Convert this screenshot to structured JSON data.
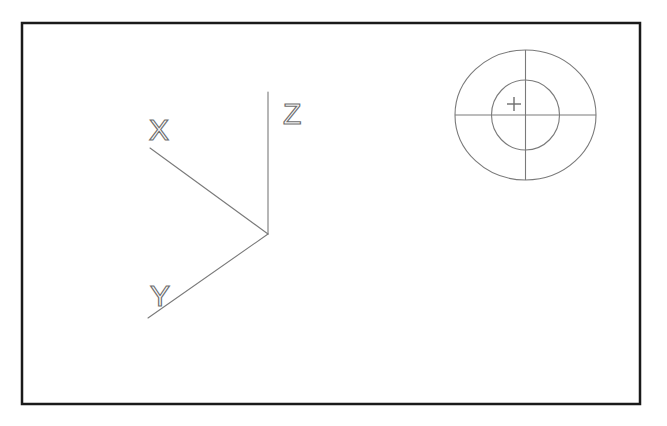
{
  "sheet": {
    "title": "CAD Drawing Sheet",
    "width": 667,
    "height": 426,
    "background_color": "#ffffff"
  },
  "border": {
    "name": "drawing-frame",
    "x": 22,
    "y": 23,
    "width": 618,
    "height": 381,
    "stroke_color": "#1a1a1a",
    "stroke_width": 2.5
  },
  "geometry": {
    "stroke_color": "#7a7a7a",
    "stroke_width": 1.1,
    "label_color": "#6e6e6e",
    "label_stroke_width": 1.2,
    "label_font_size": 30
  },
  "axis_indicator": {
    "name": "coordinate-axis-indicator",
    "origin": {
      "x": 268,
      "y": 234
    },
    "axes": [
      {
        "id": "x",
        "label": "X",
        "line": {
          "x1": 268,
          "y1": 234,
          "x2": 150,
          "y2": 148
        },
        "label_pos": {
          "x": 149,
          "y": 116
        }
      },
      {
        "id": "y",
        "label": "Y",
        "line": {
          "x1": 268,
          "y1": 234,
          "x2": 148,
          "y2": 318
        },
        "label_pos": {
          "x": 150,
          "y": 282
        }
      },
      {
        "id": "z",
        "label": "Z",
        "line": {
          "x1": 268,
          "y1": 234,
          "x2": 268,
          "y2": 92
        },
        "label_pos": {
          "x": 283,
          "y": 98
        }
      }
    ]
  },
  "datum_symbol": {
    "name": "concentric-target-symbol",
    "center": {
      "x": 525.5,
      "y": 115
    },
    "outer_circle": {
      "rx": 70.5,
      "ry": 65
    },
    "inner_circle": {
      "rx": 34,
      "ry": 35
    },
    "crosshair": {
      "horizontal": {
        "x1": 455,
        "y1": 115,
        "x2": 596,
        "y2": 115
      },
      "vertical": {
        "x1": 525.5,
        "y1": 50,
        "x2": 525.5,
        "y2": 180
      }
    },
    "plus_mark": {
      "label": "+",
      "center": {
        "x": 514,
        "y": 104
      },
      "arm_length": 7
    }
  }
}
